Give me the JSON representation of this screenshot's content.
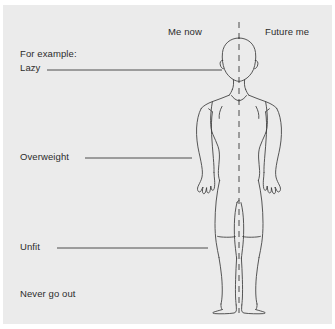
{
  "diagram": {
    "background_color": "#ebebeb",
    "outer_color": "#ffffff",
    "line_color": "#3a3a3a",
    "text_color": "#2b2b2b",
    "columns": [
      {
        "id": "me-now",
        "label": "Me now"
      },
      {
        "id": "future-me",
        "label": "Future me"
      }
    ],
    "labels": {
      "for_example": "For example:",
      "lazy": "Lazy",
      "overweight": "Overweight",
      "unfit": "Unfit",
      "never_go_out": "Never go out"
    },
    "leader_lines": [
      {
        "id": "lazy-leader",
        "x1": 47,
        "y1": 70,
        "x2": 222,
        "y2": 70
      },
      {
        "id": "overweight-leader",
        "x1": 85,
        "y1": 158,
        "x2": 192,
        "y2": 158
      },
      {
        "id": "unfit-leader",
        "x1": 57,
        "y1": 248,
        "x2": 208,
        "y2": 248
      }
    ],
    "divider": {
      "id": "center-dashed-axis",
      "x": 239,
      "y_top": 22,
      "y_bottom": 313,
      "style": "dashed"
    },
    "figure": {
      "id": "human-body-outline",
      "description": "front-view symmetrical human figure outline",
      "center_x": 239,
      "head_top": 38,
      "feet_bottom": 312
    }
  }
}
